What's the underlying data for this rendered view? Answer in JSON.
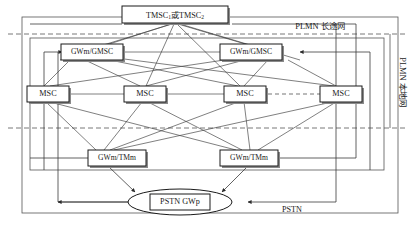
{
  "diagram": {
    "nodes": {
      "tmsc": {
        "label_prefix": "TMSC",
        "sub1": "1",
        "conjunction": "或",
        "label_mid": "TMSC",
        "sub2": "2",
        "full": "TMSC1 或 TMSC2"
      },
      "gwm_gmsc_left": {
        "label": "GWm/GMSC"
      },
      "gwm_gmsc_right": {
        "label": "GWm/GMSC"
      },
      "msc1": {
        "label": "MSC"
      },
      "msc2": {
        "label": "MSC"
      },
      "msc3": {
        "label": "MSC"
      },
      "msc4": {
        "label": "MSC"
      },
      "gwm_tmm_left": {
        "label": "GWm/TMm"
      },
      "gwm_tmm_right": {
        "label": "GWm/TMm"
      },
      "pstn_gwp": {
        "label": "PSTN GWp"
      }
    },
    "region_labels": {
      "plmn_long_distance": "PLMN 长途网",
      "plmn_local": "PLMN 本地网"
    },
    "edge_labels": {
      "pstn": "PSTN"
    },
    "colors": {
      "line": "#3a3a3a",
      "boundary": "#555555",
      "box_fill": "#ffffff",
      "shadow": "#8a8a8a",
      "text": "#1a1a1a"
    }
  }
}
